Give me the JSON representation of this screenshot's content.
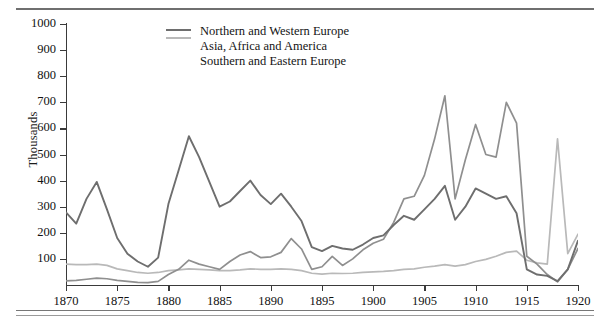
{
  "figure": {
    "ylabel": "Thousands"
  },
  "chart_data": {
    "type": "line",
    "title": "",
    "xlabel": "",
    "ylabel": "Thousands",
    "xlim": [
      1870,
      1920
    ],
    "ylim": [
      0,
      1000
    ],
    "grid": false,
    "legend_position": "top-center",
    "xticks": [
      1870,
      1875,
      1880,
      1885,
      1890,
      1895,
      1900,
      1905,
      1910,
      1915,
      1920
    ],
    "yticks": [
      100,
      200,
      300,
      400,
      500,
      600,
      700,
      800,
      900,
      1000
    ],
    "x": [
      1870,
      1871,
      1872,
      1873,
      1874,
      1875,
      1876,
      1877,
      1878,
      1879,
      1880,
      1881,
      1882,
      1883,
      1884,
      1885,
      1886,
      1887,
      1888,
      1889,
      1890,
      1891,
      1892,
      1893,
      1894,
      1895,
      1896,
      1897,
      1898,
      1899,
      1900,
      1901,
      1902,
      1903,
      1904,
      1905,
      1906,
      1907,
      1908,
      1909,
      1910,
      1911,
      1912,
      1913,
      1914,
      1915,
      1916,
      1917,
      1918,
      1919,
      1920
    ],
    "series": [
      {
        "name": "Northern and Western Europe",
        "color": "#6e6e6e",
        "values": [
          278,
          235,
          330,
          395,
          290,
          180,
          120,
          90,
          70,
          105,
          310,
          440,
          570,
          490,
          395,
          300,
          320,
          360,
          400,
          345,
          310,
          350,
          300,
          245,
          145,
          130,
          150,
          140,
          135,
          155,
          180,
          190,
          230,
          265,
          250,
          290,
          330,
          380,
          250,
          300,
          370,
          350,
          330,
          340,
          275,
          60,
          40,
          35,
          15,
          60,
          170
        ]
      },
      {
        "name": "Asia, Africa and America",
        "color": "#b9b9b9",
        "values": [
          80,
          78,
          78,
          80,
          75,
          62,
          55,
          48,
          45,
          48,
          55,
          58,
          62,
          60,
          58,
          55,
          55,
          58,
          62,
          60,
          60,
          62,
          60,
          55,
          45,
          42,
          45,
          44,
          45,
          48,
          50,
          52,
          55,
          60,
          62,
          68,
          72,
          78,
          72,
          78,
          90,
          98,
          110,
          125,
          130,
          95,
          85,
          80,
          560,
          120,
          195
        ]
      },
      {
        "name": "Southern and Eastern Europe",
        "color": "#8f8f8f",
        "values": [
          16,
          18,
          22,
          26,
          24,
          18,
          14,
          10,
          9,
          14,
          40,
          60,
          95,
          80,
          70,
          60,
          90,
          115,
          128,
          105,
          108,
          125,
          178,
          138,
          60,
          70,
          110,
          75,
          100,
          135,
          160,
          175,
          240,
          330,
          340,
          420,
          560,
          725,
          330,
          480,
          615,
          500,
          490,
          700,
          620,
          110,
          80,
          40,
          12,
          60,
          140
        ]
      }
    ]
  }
}
